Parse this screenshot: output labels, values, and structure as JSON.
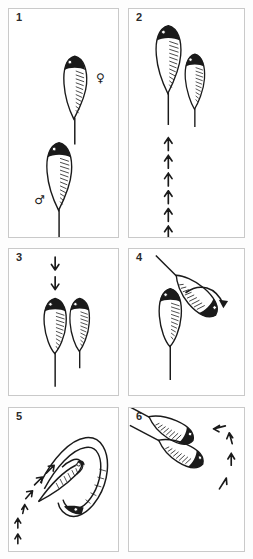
{
  "figure": {
    "caption_present": false,
    "panel_count": 6,
    "line_color": "#1a1a1a",
    "panel_border_color": "#c9c9c9",
    "panel_background": "#ffffff",
    "page_background": "#fdfdfd"
  },
  "panels": [
    {
      "number": "1",
      "name": "panel-1",
      "labels": [
        {
          "name": "female-symbol",
          "glyph": "♀",
          "meaning": "female"
        },
        {
          "name": "male-symbol",
          "glyph": "♂",
          "meaning": "male"
        }
      ],
      "fish_count": 2,
      "arrow_count": 0,
      "arrow_direction": "none"
    },
    {
      "number": "2",
      "name": "panel-2",
      "labels": [],
      "fish_count": 2,
      "arrow_count": 6,
      "arrow_direction": "up"
    },
    {
      "number": "3",
      "name": "panel-3",
      "labels": [],
      "fish_count": 2,
      "arrow_count": 2,
      "arrow_direction": "down"
    },
    {
      "number": "4",
      "name": "panel-4",
      "labels": [],
      "fish_count": 2,
      "arrow_count": 1,
      "arrow_direction": "curved-right"
    },
    {
      "number": "5",
      "name": "panel-5",
      "labels": [],
      "fish_count": 2,
      "arrow_count": 6,
      "arrow_direction": "up-right-diagonal"
    },
    {
      "number": "6",
      "name": "panel-6",
      "labels": [],
      "fish_count": 2,
      "arrow_count": 4,
      "arrow_direction": "clockwise-arc"
    }
  ]
}
